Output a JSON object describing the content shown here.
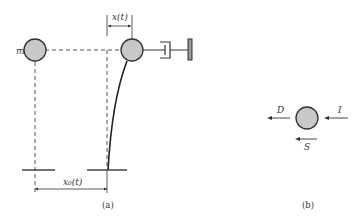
{
  "figure": {
    "panel_a": {
      "caption": "(a)",
      "mass_label": "m",
      "displacement_label": "x(t)",
      "ground_displacement_label": "x₀(t)"
    },
    "panel_b": {
      "caption": "(b)",
      "force_labels": {
        "damping": "D",
        "inertia": "I",
        "spring": "S"
      }
    },
    "colors": {
      "mass_fill": "#c8c8c8",
      "stroke": "#333333",
      "background": "#ffffff"
    }
  }
}
